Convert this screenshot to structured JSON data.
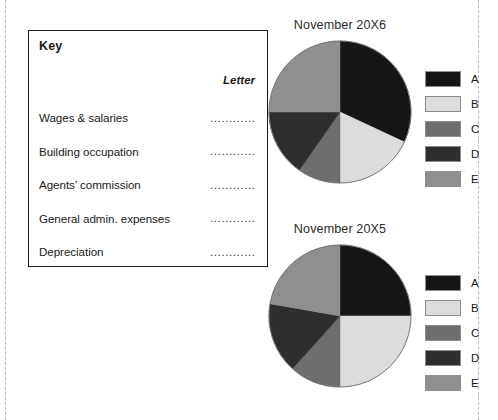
{
  "key_box": {
    "title": "Key",
    "letter_column_header": "Letter",
    "dots": "..............",
    "rows": [
      {
        "label": "Wages & salaries",
        "answer": ""
      },
      {
        "label": "Building occupation",
        "answer": ""
      },
      {
        "label": "Agents’ commission",
        "answer": ""
      },
      {
        "label": "General admin. expenses",
        "answer": ""
      },
      {
        "label": "Depreciation",
        "answer": ""
      }
    ]
  },
  "legend_colors": {
    "A": "#161616",
    "B": "#dcdcdc",
    "C": "#6e6e6e",
    "D": "#2e2e2e",
    "E": "#8f8f8f"
  },
  "charts": [
    {
      "id": "chart-20x6",
      "title": "November 20X6",
      "legend": [
        {
          "letter": "A",
          "color": "#161616"
        },
        {
          "letter": "B",
          "color": "#dcdcdc"
        },
        {
          "letter": "C",
          "color": "#6e6e6e"
        },
        {
          "letter": "D",
          "color": "#2e2e2e"
        },
        {
          "letter": "E",
          "color": "#8f8f8f"
        }
      ]
    },
    {
      "id": "chart-20x5",
      "title": "November 20X5",
      "legend": [
        {
          "letter": "A",
          "color": "#161616"
        },
        {
          "letter": "B",
          "color": "#dcdcdc"
        },
        {
          "letter": "C",
          "color": "#6e6e6e"
        },
        {
          "letter": "D",
          "color": "#2e2e2e"
        },
        {
          "letter": "E",
          "color": "#8f8f8f"
        }
      ]
    }
  ],
  "chart_data": [
    {
      "type": "pie",
      "title": "November 20X6",
      "labels": [
        "A",
        "B",
        "C",
        "D",
        "E"
      ],
      "colors": [
        "#161616",
        "#dcdcdc",
        "#6e6e6e",
        "#2e2e2e",
        "#8f8f8f"
      ],
      "start_angle_deg": 0,
      "direction": "clockwise",
      "angles_deg": [
        115,
        65,
        35,
        55,
        90
      ],
      "values_percent": [
        31.9,
        18.1,
        9.7,
        15.3,
        25.0
      ],
      "legend_position": "right"
    },
    {
      "type": "pie",
      "title": "November 20X5",
      "labels": [
        "A",
        "B",
        "C",
        "D",
        "E"
      ],
      "colors": [
        "#161616",
        "#dcdcdc",
        "#6e6e6e",
        "#2e2e2e",
        "#8f8f8f"
      ],
      "start_angle_deg": 0,
      "direction": "clockwise",
      "angles_deg": [
        90,
        90,
        42,
        58,
        80
      ],
      "values_percent": [
        25.0,
        25.0,
        11.7,
        16.1,
        22.2
      ],
      "legend_position": "right"
    }
  ]
}
